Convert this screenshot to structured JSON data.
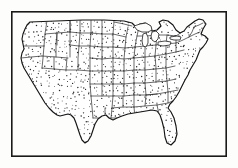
{
  "figure": {
    "style": "stippled engraving / line art",
    "background_color": "#fdfdfc",
    "line_color": "#141414",
    "border_color": "#303030",
    "stipple_color": "#262626",
    "frame": {
      "name": "rectangular-border",
      "x": 11,
      "y": 11,
      "width": 216,
      "height": 146,
      "stroke_width": 1.6,
      "color": "#1a1a1a"
    },
    "regions": [
      {
        "name": "pacific-northwest",
        "label": "Pacific Northwest"
      },
      {
        "name": "california-coast",
        "label": "California Coast"
      },
      {
        "name": "great-basin",
        "label": "Great Basin"
      },
      {
        "name": "northern-plains",
        "label": "Northern Plains"
      },
      {
        "name": "great-lakes",
        "label": "Great Lakes"
      },
      {
        "name": "northeast",
        "label": "Northeast"
      },
      {
        "name": "atlantic-coast",
        "label": "Atlantic Coast"
      },
      {
        "name": "florida-peninsula",
        "label": "Florida Peninsula"
      },
      {
        "name": "gulf-coast",
        "label": "Gulf Coast"
      },
      {
        "name": "texas",
        "label": "Texas"
      }
    ],
    "features": {
      "state_boundaries": true,
      "stipple_fill": true,
      "great_lakes_unfilled": true,
      "labels": false,
      "legend": false,
      "compass": false,
      "scale_bar": false
    },
    "dimensions": {
      "width": 238,
      "height": 168
    }
  }
}
